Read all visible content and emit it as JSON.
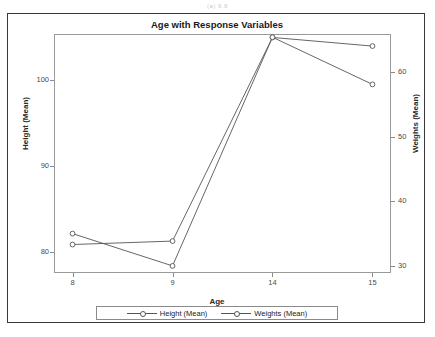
{
  "caption": "(a) 9.9",
  "chart_title": "Age with Response Variables",
  "axes": {
    "x_label": "Age",
    "y_left_label": "Height (Mean)",
    "y_right_label": "Weights (Mean)",
    "x_ticks": [
      "8",
      "9",
      "14",
      "15"
    ],
    "y_left_ticks": [
      "80",
      "90",
      "100"
    ],
    "y_right_ticks": [
      "30",
      "40",
      "50",
      "60"
    ]
  },
  "legend": {
    "items": [
      {
        "label": "Height (Mean)",
        "marker": "circle-open",
        "color": "#555555"
      },
      {
        "label": "Weights (Mean)",
        "marker": "circle-open",
        "color": "#555555"
      }
    ]
  },
  "chart_data": {
    "type": "line",
    "title": "Age with Response Variables",
    "xlabel": "Age",
    "ylabel": "Height (Mean)",
    "y2label": "Weights (Mean)",
    "categories": [
      "8",
      "9",
      "14",
      "15"
    ],
    "x": [
      8,
      9,
      14,
      15
    ],
    "grid": false,
    "legend_position": "bottom",
    "ylim": [
      77.6,
      105.3
    ],
    "y2lim": [
      28.9,
      65.9
    ],
    "y_left_ticks": [
      80,
      90,
      100
    ],
    "y_right_ticks": [
      30,
      40,
      50,
      60
    ],
    "series": [
      {
        "name": "Height (Mean)",
        "axis": "left",
        "marker": "circle-open",
        "color": "#555555",
        "values": [
          80.9,
          81.3,
          104.9,
          103.9
        ]
      },
      {
        "name": "Weights (Mean)",
        "axis": "right",
        "marker": "circle-open",
        "color": "#555555",
        "values": [
          35.0,
          30.0,
          65.4,
          58.1
        ]
      }
    ]
  }
}
